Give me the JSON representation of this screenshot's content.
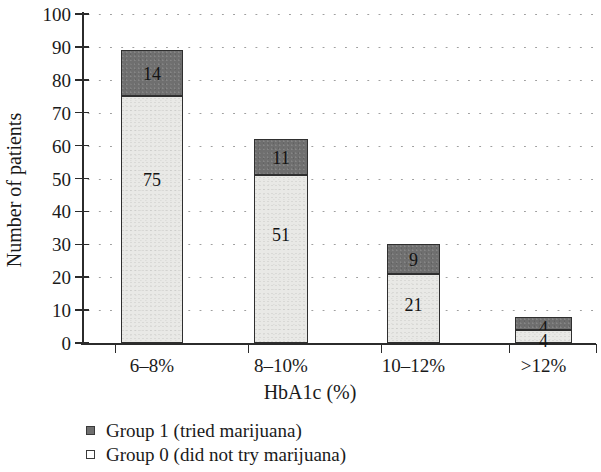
{
  "chart_data": {
    "type": "bar",
    "subtype": "stacked-bar",
    "title": "",
    "xlabel": "HbA1c (%)",
    "ylabel": "Number of patients",
    "categories": [
      "6–8%",
      "8–10%",
      "10–12%",
      ">12%"
    ],
    "series": [
      {
        "name": "Group 0 (did not try marijuana)",
        "values": [
          75,
          51,
          21,
          4
        ],
        "color": "#e9e9e6",
        "stack_order": 0
      },
      {
        "name": "Group 1 (tried marijuana)",
        "values": [
          14,
          11,
          9,
          4
        ],
        "color": "#6f6f6f",
        "stack_order": 1
      }
    ],
    "totals": [
      89,
      62,
      30,
      8
    ],
    "ylim": [
      0,
      100
    ],
    "ytick_labels": [
      "0",
      "10",
      "20",
      "30",
      "40",
      "50",
      "60",
      "70",
      "80",
      "90",
      "100"
    ],
    "ytick_values": [
      0,
      10,
      20,
      30,
      40,
      50,
      60,
      70,
      80,
      90,
      100
    ],
    "grid": "horizontal-dotted",
    "legend_position": "below-axis-left",
    "legend": [
      {
        "marker": "filled-square",
        "label": "Group 1 (tried marijuana)"
      },
      {
        "marker": "open-square",
        "label": "Group 0 (did not try marijuana)"
      }
    ]
  }
}
